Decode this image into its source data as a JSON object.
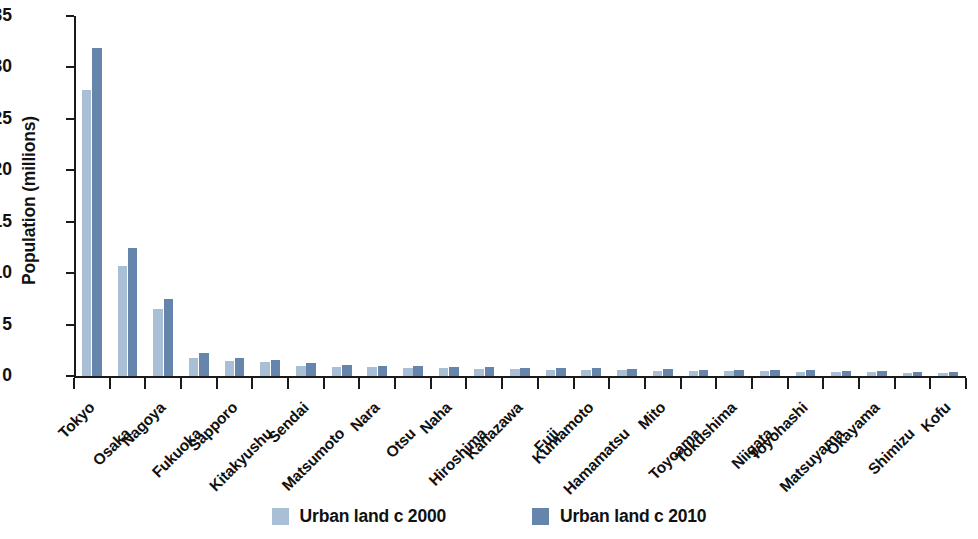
{
  "chart_data": {
    "type": "bar",
    "title": "",
    "subtitle": "",
    "xlabel": "",
    "ylabel": "Population (millions)",
    "ylim": [
      0,
      35
    ],
    "yticks": [
      0,
      5,
      10,
      15,
      20,
      25,
      30,
      35
    ],
    "ytick_labels": [
      "0",
      "5",
      "10",
      "15",
      "20",
      "25",
      "30",
      "35"
    ],
    "grid": false,
    "legend_position": "bottom",
    "categories": [
      "Tokyo",
      "Osaka",
      "Nagoya",
      "Fukuoka",
      "Sapporo",
      "Kitakyushu",
      "Sendai",
      "Matsumoto",
      "Nara",
      "Otsu",
      "Naha",
      "Hiroshima",
      "Kanazawa",
      "Fuji",
      "Kumamoto",
      "Hamamatsu",
      "Mito",
      "Toyoama",
      "Tokushima",
      "Niigata",
      "Toyohashi",
      "Matsuyama",
      "Okayama",
      "Shimizu",
      "Kofu"
    ],
    "series": [
      {
        "name": "Urban land c 2000",
        "color": "#a9bfd6",
        "values": [
          27.8,
          10.7,
          6.5,
          1.8,
          1.5,
          1.4,
          1.0,
          0.9,
          0.85,
          0.8,
          0.75,
          0.7,
          0.65,
          0.6,
          0.6,
          0.55,
          0.5,
          0.5,
          0.45,
          0.45,
          0.4,
          0.4,
          0.35,
          0.3,
          0.3
        ]
      },
      {
        "name": "Urban land c 2010",
        "color": "#6585ac",
        "values": [
          31.9,
          12.4,
          7.5,
          2.2,
          1.8,
          1.6,
          1.3,
          1.1,
          1.0,
          0.95,
          0.9,
          0.85,
          0.8,
          0.75,
          0.75,
          0.7,
          0.65,
          0.6,
          0.6,
          0.55,
          0.55,
          0.5,
          0.45,
          0.4,
          0.4
        ]
      }
    ]
  },
  "legend": {
    "items": [
      {
        "label": "Urban land c 2000",
        "color": "#a9bfd6"
      },
      {
        "label": "Urban land c 2010",
        "color": "#6585ac"
      }
    ]
  }
}
